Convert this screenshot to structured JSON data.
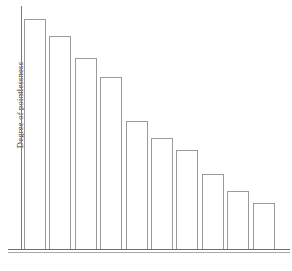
{
  "chart_data": {
    "type": "bar",
    "title": "",
    "subtitle": "",
    "xlabel": "",
    "ylabel": "Degree of pointlessness",
    "ylim": [
      0,
      100
    ],
    "grid": false,
    "legend": false,
    "axis_tick_labels": [],
    "categories": [
      "Pedicure",
      "Colonic irrigation",
      "Facial waxing (excluding eyebrows)",
      "Any all-over body treatment (including scrubs, wraps and exfoliation)",
      "Manicure",
      "Facial",
      "Leg wax",
      "Bikini wax",
      "Eyebrow shaping",
      "Massage"
    ],
    "footnote_markers": [
      "1",
      "2",
      "3",
      "4",
      "5",
      "6",
      "7",
      "8",
      "9",
      "10"
    ],
    "values": [
      95,
      88,
      79,
      71,
      53,
      46,
      41,
      31,
      24,
      19
    ]
  },
  "bars": [
    {
      "label": "Pedicure",
      "marker": "1",
      "value": 95,
      "two_line": false,
      "line1": "Pedicure",
      "line2": ""
    },
    {
      "label": "Colonic irrigation",
      "marker": "2",
      "value": 88,
      "two_line": false,
      "line1": "Colonic irrigation",
      "line2": ""
    },
    {
      "label": "Facial waxing (excluding eyebrows)",
      "marker": "3",
      "value": 79,
      "two_line": false,
      "line1": "Facial waxing (excluding eyebrows)",
      "line2": ""
    },
    {
      "label": "Any all-over body treatment (including scrubs, wraps and exfoliation)",
      "marker": "4",
      "value": 71,
      "two_line": true,
      "line1": "Any all-over body treatment",
      "line2": "(including scrubs, wraps and exfoliation)"
    },
    {
      "label": "Manicure",
      "marker": "5",
      "value": 53,
      "two_line": false,
      "line1": "Manicure",
      "line2": ""
    },
    {
      "label": "Facial",
      "marker": "6",
      "value": 46,
      "two_line": false,
      "line1": "Facial",
      "line2": ""
    },
    {
      "label": "Leg wax",
      "marker": "7",
      "value": 41,
      "two_line": false,
      "line1": "Leg wax",
      "line2": ""
    },
    {
      "label": "Bikini wax",
      "marker": "8",
      "value": 31,
      "two_line": false,
      "line1": "Bikini wax",
      "line2": ""
    },
    {
      "label": "Eyebrow shaping",
      "marker": "9",
      "value": 24,
      "two_line": true,
      "line1": "Eyebrow",
      "line2": "shaping"
    },
    {
      "label": "Massage",
      "marker": "10",
      "value": 19,
      "two_line": false,
      "line1": "Massage",
      "line2": ""
    }
  ],
  "axes": {
    "y_title": "Degree of pointlessness"
  },
  "colors": {
    "bar_outline": "#9a9a9a",
    "bar_fill": "#ffffff",
    "axis": "#6e6e6e",
    "text": "#222222",
    "background": "#ffffff"
  }
}
